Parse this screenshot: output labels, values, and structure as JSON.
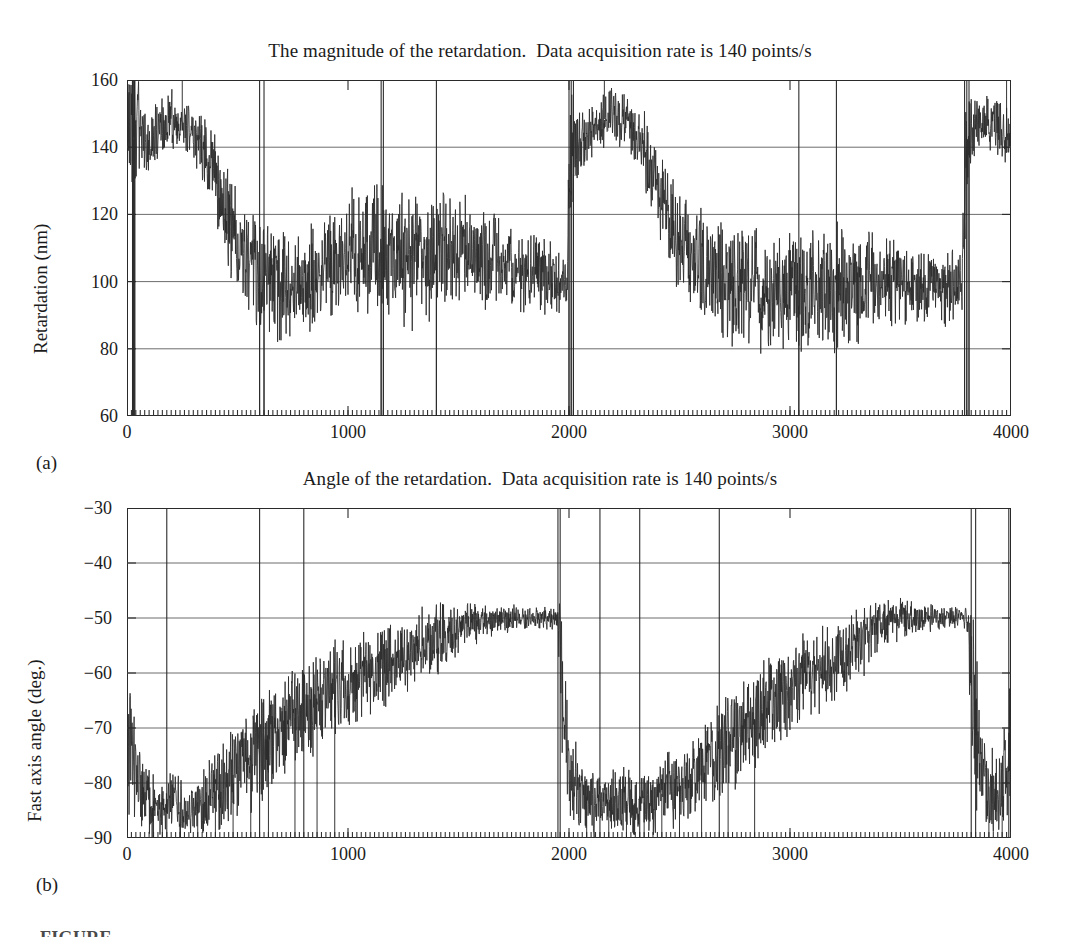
{
  "figure": {
    "panel_labels": {
      "a": "(a)",
      "b": "(b)"
    },
    "caption_partial": "FIGURE"
  },
  "chart_data": [
    {
      "id": "a",
      "type": "line",
      "title": "The magnitude of the retardation.  Data acquisition rate is 140 points/s",
      "xlabel": "",
      "ylabel": "Retardation (nm)",
      "xlim": [
        0,
        4000
      ],
      "ylim": [
        60,
        160
      ],
      "xticks": [
        0,
        1000,
        2000,
        3000,
        4000
      ],
      "xticklabels": [
        "0",
        "1000",
        "2000",
        "3000",
        "4000"
      ],
      "yticks": [
        60,
        80,
        100,
        120,
        140,
        160
      ],
      "yticklabels": [
        "60",
        "80",
        "100",
        "120",
        "140",
        "160"
      ],
      "grid": "horizontal",
      "minor_xticks_step": 20,
      "line_color": "#2b2b2b",
      "grid_color": "#6d6d6d",
      "series": [
        {
          "name": "Retardation",
          "note": "Dense noisy trace, 4000 samples at 140 points/s; envelope given as anchor points (x, mean, spread) with frequent full-range dropout spikes to the 60 nm baseline.",
          "envelope": [
            [
              0,
              150,
              18
            ],
            [
              20,
              140,
              40
            ],
            [
              40,
              145,
              30
            ],
            [
              60,
              143,
              16
            ],
            [
              100,
              141,
              14
            ],
            [
              150,
              146,
              12
            ],
            [
              200,
              148,
              13
            ],
            [
              250,
              145,
              14
            ],
            [
              300,
              142,
              15
            ],
            [
              350,
              138,
              16
            ],
            [
              400,
              130,
              18
            ],
            [
              450,
              120,
              20
            ],
            [
              500,
              112,
              22
            ],
            [
              550,
              106,
              24
            ],
            [
              600,
              102,
              26
            ],
            [
              700,
              100,
              26
            ],
            [
              800,
              101,
              24
            ],
            [
              900,
              104,
              24
            ],
            [
              1000,
              108,
              26
            ],
            [
              1100,
              110,
              28
            ],
            [
              1200,
              108,
              28
            ],
            [
              1300,
              106,
              28
            ],
            [
              1400,
              107,
              26
            ],
            [
              1500,
              110,
              24
            ],
            [
              1600,
              108,
              22
            ],
            [
              1700,
              105,
              20
            ],
            [
              1800,
              103,
              18
            ],
            [
              1900,
              102,
              16
            ],
            [
              1990,
              100,
              16
            ],
            [
              2000,
              135,
              35
            ],
            [
              2020,
              138,
              22
            ],
            [
              2060,
              142,
              14
            ],
            [
              2100,
              145,
              12
            ],
            [
              2150,
              148,
              11
            ],
            [
              2200,
              150,
              12
            ],
            [
              2250,
              148,
              12
            ],
            [
              2300,
              144,
              14
            ],
            [
              2350,
              138,
              16
            ],
            [
              2400,
              128,
              20
            ],
            [
              2450,
              118,
              22
            ],
            [
              2500,
              110,
              24
            ],
            [
              2600,
              104,
              26
            ],
            [
              2700,
              100,
              26
            ],
            [
              2800,
              98,
              26
            ],
            [
              2900,
              96,
              26
            ],
            [
              3000,
              97,
              26
            ],
            [
              3100,
              98,
              26
            ],
            [
              3200,
              97,
              28
            ],
            [
              3300,
              99,
              24
            ],
            [
              3400,
              100,
              20
            ],
            [
              3500,
              99,
              18
            ],
            [
              3600,
              99,
              16
            ],
            [
              3700,
              98,
              16
            ],
            [
              3780,
              100,
              18
            ],
            [
              3800,
              140,
              30
            ],
            [
              3830,
              145,
              14
            ],
            [
              3880,
              148,
              12
            ],
            [
              3930,
              146,
              12
            ],
            [
              3980,
              143,
              13
            ],
            [
              4000,
              145,
              14
            ]
          ],
          "dropout_x": [
            25,
            30,
            35,
            600,
            620,
            1150,
            1160,
            1400,
            2000,
            2010,
            2020,
            3040,
            3210,
            3790,
            3800,
            3810
          ],
          "top_spike_x": [
            35,
            250,
            2160,
            3980
          ]
        }
      ]
    },
    {
      "id": "b",
      "type": "line",
      "title": "Angle of the retardation.  Data acquisition rate is 140 points/s",
      "xlabel": "",
      "ylabel": "Fast axis angle (deg.)",
      "xlim": [
        0,
        4000
      ],
      "ylim": [
        -90,
        -30
      ],
      "xticks": [
        0,
        1000,
        2000,
        3000,
        4000
      ],
      "xticklabels": [
        "0",
        "1000",
        "2000",
        "3000",
        "4000"
      ],
      "yticks": [
        -90,
        -80,
        -70,
        -60,
        -50,
        -40,
        -30
      ],
      "yticklabels": [
        "−90",
        "−80",
        "−70",
        "−60",
        "−50",
        "−40",
        "−30"
      ],
      "grid": "horizontal",
      "minor_xticks_step": 20,
      "line_color": "#2b2b2b",
      "grid_color": "#6d6d6d",
      "series": [
        {
          "name": "Fast axis angle",
          "note": "Noisy sawtooth ramp from about -85 deg up to -50 deg, repeating twice; wrap-around transitions appear as full-height vertical lines.",
          "envelope": [
            [
              0,
              -70,
              22
            ],
            [
              40,
              -78,
              14
            ],
            [
              80,
              -82,
              10
            ],
            [
              140,
              -84,
              8
            ],
            [
              200,
              -83,
              9
            ],
            [
              280,
              -84,
              8
            ],
            [
              360,
              -83,
              9
            ],
            [
              440,
              -80,
              12
            ],
            [
              520,
              -77,
              13
            ],
            [
              600,
              -74,
              14
            ],
            [
              700,
              -70,
              14
            ],
            [
              800,
              -67,
              14
            ],
            [
              900,
              -64,
              13
            ],
            [
              1000,
              -62,
              12
            ],
            [
              1100,
              -60,
              12
            ],
            [
              1200,
              -58,
              11
            ],
            [
              1300,
              -56,
              10
            ],
            [
              1400,
              -54,
              9
            ],
            [
              1500,
              -52,
              7
            ],
            [
              1600,
              -51,
              5
            ],
            [
              1700,
              -50,
              4
            ],
            [
              1800,
              -50,
              3
            ],
            [
              1900,
              -50,
              3
            ],
            [
              1950,
              -50,
              3
            ],
            [
              1970,
              -62,
              28
            ],
            [
              2000,
              -78,
              14
            ],
            [
              2060,
              -82,
              10
            ],
            [
              2140,
              -84,
              8
            ],
            [
              2220,
              -83,
              9
            ],
            [
              2300,
              -84,
              8
            ],
            [
              2380,
              -83,
              9
            ],
            [
              2460,
              -81,
              11
            ],
            [
              2540,
              -79,
              12
            ],
            [
              2620,
              -77,
              13
            ],
            [
              2700,
              -74,
              14
            ],
            [
              2800,
              -70,
              14
            ],
            [
              2900,
              -66,
              13
            ],
            [
              3000,
              -63,
              13
            ],
            [
              3100,
              -60,
              12
            ],
            [
              3200,
              -58,
              11
            ],
            [
              3300,
              -55,
              10
            ],
            [
              3400,
              -52,
              8
            ],
            [
              3500,
              -50,
              5
            ],
            [
              3600,
              -50,
              4
            ],
            [
              3700,
              -50,
              3
            ],
            [
              3800,
              -50,
              3
            ],
            [
              3830,
              -66,
              26
            ],
            [
              3880,
              -80,
              12
            ],
            [
              3940,
              -82,
              10
            ],
            [
              3980,
              -78,
              14
            ],
            [
              4000,
              -70,
              18
            ]
          ],
          "wrap_x": [
            180,
            600,
            800,
            1950,
            1960,
            2140,
            2320,
            2680,
            3820,
            3840,
            3990
          ],
          "floor_x": [
            120,
            160,
            240,
            320,
            400,
            480,
            560,
            640,
            760,
            860,
            940,
            2080,
            2180,
            2260,
            2340,
            2420,
            2500,
            2600,
            2720,
            2840,
            3900,
            3960
          ]
        }
      ]
    }
  ]
}
